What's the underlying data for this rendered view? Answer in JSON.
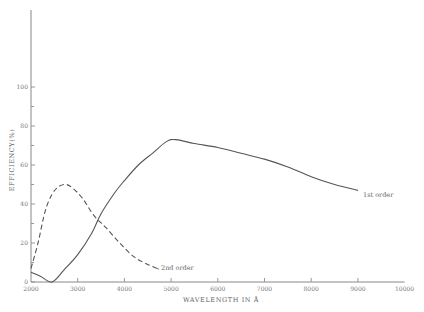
{
  "chart_data": {
    "type": "line",
    "title": "",
    "xlabel": "WAVELENGTH IN Å",
    "ylabel": "EFFICIENCY(%)",
    "xlim": [
      2000,
      10000
    ],
    "ylim": [
      0,
      120
    ],
    "x_ticks": [
      2000,
      3000,
      4000,
      5000,
      6000,
      7000,
      8000,
      9000,
      10000
    ],
    "y_ticks": [
      0,
      20,
      40,
      60,
      80,
      100
    ],
    "y_minor_ticks": [
      10,
      30,
      50,
      70,
      90
    ],
    "grid": false,
    "legend": "inline labels at curve ends",
    "series": [
      {
        "name": "1st order",
        "style": "solid",
        "x": [
          2000,
          2200,
          2450,
          2700,
          3000,
          3300,
          3500,
          3800,
          4000,
          4300,
          4600,
          4900,
          5100,
          5500,
          6000,
          6500,
          7000,
          7500,
          8000,
          8500,
          9000
        ],
        "y": [
          5,
          3,
          0,
          6,
          14,
          25,
          35,
          46,
          52,
          60,
          66,
          72,
          73,
          71,
          69,
          66,
          63,
          59,
          54,
          50,
          47
        ]
      },
      {
        "name": "2nd order",
        "style": "dashed",
        "x": [
          2000,
          2150,
          2300,
          2450,
          2600,
          2750,
          2900,
          3100,
          3350,
          3600,
          3900,
          4200,
          4500,
          4700
        ],
        "y": [
          7,
          20,
          36,
          45,
          49,
          50,
          48,
          43,
          34,
          28,
          20,
          13,
          9,
          7
        ]
      }
    ]
  },
  "labels": {
    "series1_label": "1st order",
    "series2_label": "2nd order",
    "xlabel": "WAVELENGTH IN Å",
    "ylabel": "EFFICIENCY(%)"
  },
  "colors": {
    "line": "#555555",
    "axis": "#888888",
    "text": "#666666"
  }
}
